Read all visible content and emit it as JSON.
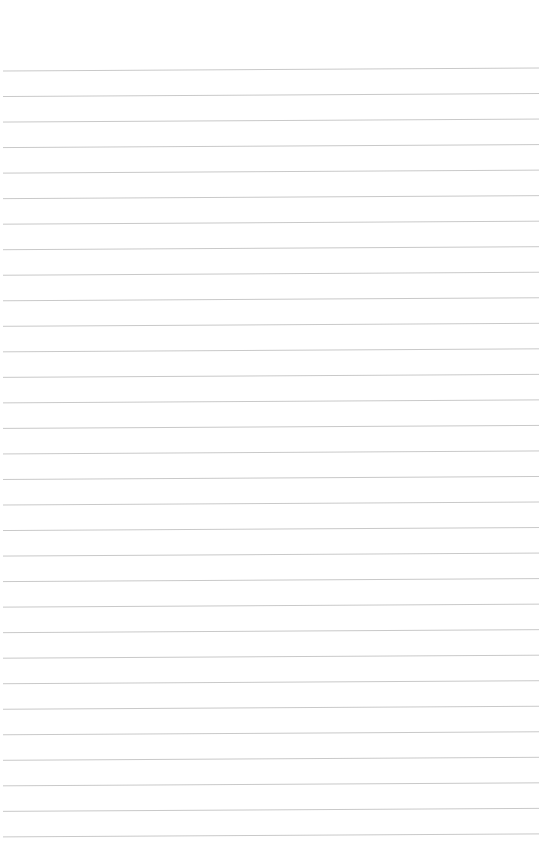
{
  "page": {
    "type": "blank-lined-paper",
    "background_color": "#ffffff",
    "rule_color": "#c9c9c9",
    "rule_count": 31,
    "first_rule_left_y": 71,
    "first_rule_right_y": 68,
    "rule_spacing": 25.53,
    "rule_left_x": 3,
    "rule_right_x": 539,
    "text_lines": []
  }
}
